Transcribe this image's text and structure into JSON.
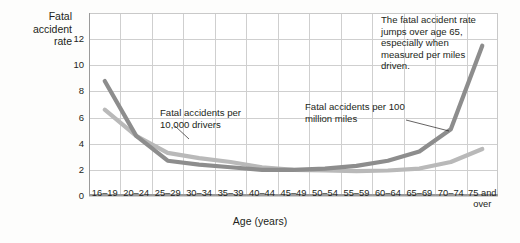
{
  "chart_data": {
    "type": "line",
    "title": "",
    "xlabel": "Age (years)",
    "ylabel": "Fatal accident rate",
    "categories": [
      "16–19",
      "20–24",
      "25–29",
      "30–34",
      "35–39",
      "40–44",
      "45–49",
      "50–54",
      "55–59",
      "60–64",
      "65–69",
      "70–74",
      "75 and over"
    ],
    "ylim": [
      0,
      14
    ],
    "yticks": [
      0,
      2,
      4,
      6,
      8,
      10,
      12
    ],
    "grid": true,
    "legend_position": "inline-annotations",
    "series": [
      {
        "name": "Fatal accidents per 100 million miles",
        "color": "#8d8d8d",
        "values": [
          8.8,
          4.6,
          2.7,
          2.4,
          2.2,
          2.0,
          2.0,
          2.1,
          2.3,
          2.7,
          3.4,
          5.1,
          11.5
        ]
      },
      {
        "name": "Fatal accidents per 10,000 drivers",
        "color": "#b9b9b9",
        "values": [
          6.6,
          4.6,
          3.3,
          2.9,
          2.6,
          2.2,
          2.0,
          1.95,
          1.9,
          1.95,
          2.1,
          2.6,
          3.6
        ]
      }
    ],
    "annotations": [
      {
        "id": "callout",
        "text": "The fatal accident rate jumps over age 65, especially when measured per miles driven."
      },
      {
        "id": "drivers",
        "text": "Fatal accidents per 10,000 drivers"
      },
      {
        "id": "miles",
        "text": "Fatal accidents per 100 million miles"
      }
    ]
  },
  "axis": {
    "y_title_line1": "Fatal",
    "y_title_line2": "accident",
    "y_title_line3": "rate",
    "x_title": "Age (years)"
  }
}
